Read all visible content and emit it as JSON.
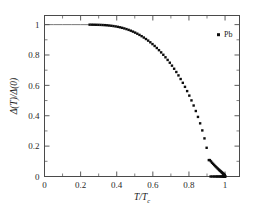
{
  "figure": {
    "background": "#ffffff",
    "frame_color": "#4a4a4a",
    "marker_color": "#0d0d0d",
    "line_color": "#555555"
  },
  "legend": {
    "entries": [
      {
        "label": "Pb",
        "marker": "filled-square",
        "color": "#0d0d0d"
      }
    ],
    "position": "top-right"
  },
  "axis": {
    "x_label_num": "T",
    "x_label_den": "T",
    "x_label_den_sub": "c",
    "y_label": "Δ(T)/Δ(0)"
  },
  "chart_data": {
    "type": "scatter",
    "title": "",
    "subtitle": "",
    "xlabel": "T/T_c",
    "ylabel": "Δ(T)/Δ(0)",
    "xlim": [
      0,
      1.08
    ],
    "ylim": [
      0,
      1.06
    ],
    "grid": false,
    "legend_position": "top-right",
    "xticks": [
      0,
      0.2,
      0.4,
      0.6,
      0.8,
      1
    ],
    "xticklabels": [
      "0",
      "0.2",
      "0.4",
      "0.6",
      "0.8",
      "1"
    ],
    "xminorticks": [
      0.1,
      0.3,
      0.5,
      0.7,
      0.9
    ],
    "yticks": [
      0,
      0.2,
      0.4,
      0.6,
      0.8,
      1
    ],
    "yticklabels": [
      "0",
      "0.2",
      "0.4",
      "0.6",
      "0.8",
      "1"
    ],
    "yminorticks": [
      0.1,
      0.3,
      0.5,
      0.7,
      0.9
    ],
    "series": [
      {
        "name": "guide-line",
        "type": "line",
        "color": "#555555",
        "x": [
          0.0,
          0.05,
          0.1,
          0.15,
          0.2,
          0.25
        ],
        "values": [
          1.0,
          1.0,
          1.0,
          1.0,
          0.9999,
          0.9996
        ]
      },
      {
        "name": "Pb",
        "type": "scatter",
        "marker": "filled-square",
        "color": "#0d0d0d",
        "x": [
          0.25,
          0.262,
          0.274,
          0.286,
          0.298,
          0.31,
          0.322,
          0.334,
          0.346,
          0.358,
          0.37,
          0.382,
          0.394,
          0.406,
          0.418,
          0.43,
          0.442,
          0.454,
          0.466,
          0.478,
          0.49,
          0.502,
          0.514,
          0.526,
          0.538,
          0.55,
          0.562,
          0.574,
          0.586,
          0.598,
          0.61,
          0.622,
          0.634,
          0.646,
          0.658,
          0.67,
          0.682,
          0.694,
          0.706,
          0.718,
          0.73,
          0.742,
          0.754,
          0.766,
          0.778,
          0.79,
          0.802,
          0.814,
          0.826,
          0.838,
          0.85,
          0.862,
          0.874,
          0.886,
          0.898,
          0.91,
          0.92,
          0.93,
          0.94,
          0.948,
          0.956,
          0.963,
          0.97,
          0.976,
          0.981,
          0.986,
          0.99,
          0.993,
          0.996,
          0.998,
          0.999,
          1.0
        ],
        "values": [
          0.9996,
          0.9995,
          0.9993,
          0.999,
          0.9986,
          0.9981,
          0.9974,
          0.9965,
          0.9954,
          0.994,
          0.9924,
          0.9904,
          0.9881,
          0.9854,
          0.9823,
          0.9788,
          0.9748,
          0.9704,
          0.9654,
          0.9599,
          0.9539,
          0.9473,
          0.9401,
          0.9323,
          0.9239,
          0.9148,
          0.9051,
          0.8947,
          0.8836,
          0.8718,
          0.8593,
          0.846,
          0.8319,
          0.8171,
          0.8014,
          0.7849,
          0.7675,
          0.7491,
          0.7298,
          0.7095,
          0.6881,
          0.6656,
          0.6418,
          0.6168,
          0.5903,
          0.5623,
          0.5326,
          0.501,
          0.4673,
          0.4312,
          0.3923,
          0.35,
          0.3034,
          0.2509,
          0.189,
          0.108,
          0.0,
          0.0,
          0.0,
          0.0,
          0.0,
          0.0,
          0.0,
          0.0,
          0.0,
          0.0,
          0.0,
          0.0,
          0.0,
          0.0,
          0.0,
          0.0
        ]
      },
      {
        "name": "Pb-tail",
        "type": "scatter",
        "marker": "filled-square",
        "color": "#0d0d0d",
        "x": [
          0.916,
          0.922,
          0.928,
          0.934,
          0.94,
          0.946,
          0.952,
          0.958,
          0.963,
          0.968,
          0.972,
          0.976,
          0.98,
          0.983,
          0.986,
          0.989,
          0.991,
          0.993,
          0.995,
          0.996,
          0.9975,
          0.9985,
          0.9992,
          0.9997,
          1.0
        ],
        "values": [
          0.108,
          0.0995,
          0.0905,
          0.083,
          0.0755,
          0.068,
          0.061,
          0.054,
          0.0482,
          0.0425,
          0.0382,
          0.034,
          0.0296,
          0.0262,
          0.0228,
          0.0192,
          0.0168,
          0.0144,
          0.0118,
          0.0104,
          0.008,
          0.0058,
          0.004,
          0.002,
          0.0
        ]
      }
    ]
  }
}
